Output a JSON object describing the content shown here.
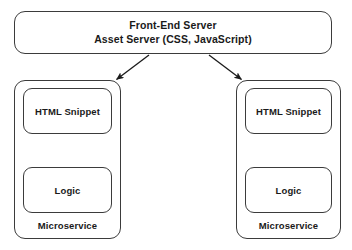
{
  "diagram": {
    "type": "architecture-block-diagram",
    "background_color": "#ffffff",
    "stroke_color": "#3b3b3b",
    "text_color": "#1a1a1a",
    "front_end": {
      "line1": "Front-End Server",
      "line2": "Asset Server (CSS, JavaScript)"
    },
    "microservices": [
      {
        "label": "Microservice",
        "snippet_label": "HTML Snippet",
        "logic_label": "Logic"
      },
      {
        "label": "Microservice",
        "snippet_label": "HTML Snippet",
        "logic_label": "Logic"
      }
    ],
    "connectors": [
      {
        "name": "frontend-to-left-microservice",
        "style": "single-arrow"
      },
      {
        "name": "frontend-to-right-microservice",
        "style": "single-arrow"
      },
      {
        "name": "left-snippet-logic-link",
        "style": "double-arrow"
      },
      {
        "name": "right-snippet-logic-link",
        "style": "double-arrow"
      }
    ]
  }
}
